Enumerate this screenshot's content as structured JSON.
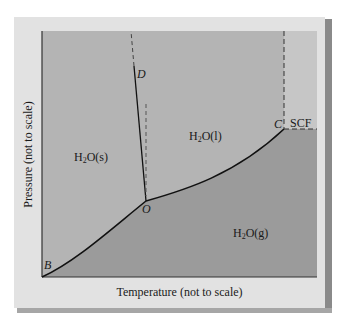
{
  "diagram": {
    "type": "phase-diagram",
    "x_axis_label": "Temperature (not to scale)",
    "y_axis_label": "Pressure (not to scale)",
    "regions": {
      "solid": {
        "formula": "H",
        "sub": "2",
        "rest": "O(s)"
      },
      "liquid": {
        "formula": "H",
        "sub": "2",
        "rest": "O(l)"
      },
      "gas": {
        "formula": "H",
        "sub": "2",
        "rest": "O(g)"
      },
      "supercritical": "SCF"
    },
    "points": {
      "B": "B",
      "O": "O",
      "C": "C",
      "D": "D"
    },
    "colors": {
      "card": "#e2e2e2",
      "solid_liquid_region": "#b4b4b4",
      "gas_region": "#9b9b9b",
      "scf_region": "#c6c6c6",
      "line": "#111111"
    }
  }
}
